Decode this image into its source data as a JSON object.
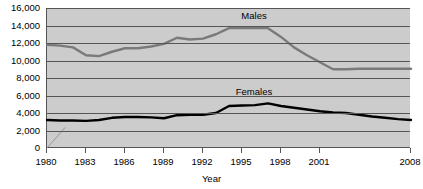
{
  "chart_data": {
    "type": "line",
    "title": "",
    "xlabel": "Year",
    "ylabel": "",
    "xlim": [
      1980,
      2008
    ],
    "ylim": [
      0,
      16000
    ],
    "grid": true,
    "legend_position": "inline-labels",
    "x": [
      1980,
      1981,
      1982,
      1983,
      1984,
      1985,
      1986,
      1987,
      1988,
      1989,
      1990,
      1991,
      1992,
      1993,
      1994,
      1995,
      1996,
      1997,
      1998,
      1999,
      2000,
      2001,
      2002,
      2003,
      2004,
      2005,
      2006,
      2007,
      2008
    ],
    "xticks": [
      "1980",
      "1983",
      "1986",
      "1989",
      "1992",
      "1995",
      "1998",
      "2001",
      "2008"
    ],
    "xtick_values": [
      1980,
      1983,
      1986,
      1989,
      1992,
      1995,
      1998,
      2001,
      2008
    ],
    "yticks": [
      "0",
      "2,000",
      "4,000",
      "6,000",
      "8,000",
      "10,000",
      "12,000",
      "14,000",
      "16,000"
    ],
    "ytick_values": [
      0,
      2000,
      4000,
      6000,
      8000,
      10000,
      12000,
      14000,
      16000
    ],
    "series": [
      {
        "name": "Males",
        "color": "#7a7a7a",
        "values": [
          11800,
          11700,
          11500,
          10600,
          10500,
          11000,
          11400,
          11400,
          11600,
          11900,
          12600,
          12400,
          12500,
          13000,
          13700,
          13700,
          13700,
          13700,
          12700,
          11500,
          10600,
          9800,
          9000,
          9000,
          9050,
          9050,
          9050,
          9050,
          9050
        ],
        "label_x": 1996,
        "label_y": 15100
      },
      {
        "name": "Females",
        "color": "#000000",
        "values": [
          3200,
          3150,
          3150,
          3100,
          3200,
          3450,
          3550,
          3550,
          3500,
          3400,
          3750,
          3800,
          3800,
          4000,
          4800,
          4850,
          4900,
          5100,
          4800,
          4600,
          4400,
          4200,
          4050,
          4000,
          3800,
          3600,
          3450,
          3300,
          3200
        ],
        "label_x": 1996,
        "label_y": 6450
      }
    ]
  },
  "axes": {
    "x_title": "Year"
  }
}
